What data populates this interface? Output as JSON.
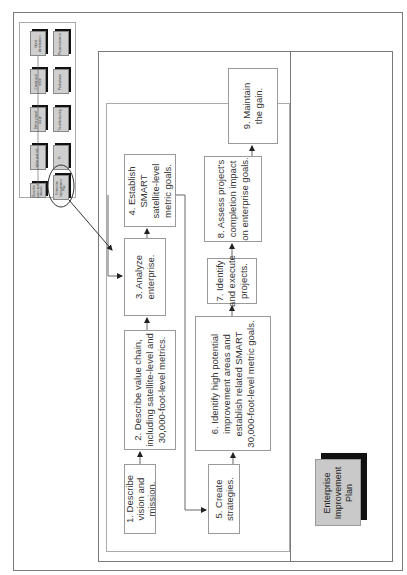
{
  "thumbnail": {
    "top_row": [
      "Need identification",
      "Create and refine",
      "Define project scope",
      "Value and risk",
      "Describe vision and mission"
    ],
    "bottom_row": [
      "Project closeout",
      "Productivize",
      "Troubleshooting",
      "Pi",
      "Enterprise Improvement Plan"
    ],
    "highlighted": "Enterprise Improvement Plan"
  },
  "steps": [
    {
      "id": 1,
      "label": "1. Describe vision and mission."
    },
    {
      "id": 2,
      "label": "2. Describe value chain, including satellite-level and 30,000-foot-level metrics."
    },
    {
      "id": 3,
      "label": "3. Analyze enterprise."
    },
    {
      "id": 4,
      "label": "4. Establish SMART satellite-level metric goals."
    },
    {
      "id": 5,
      "label": "5. Create strategies."
    },
    {
      "id": 6,
      "label": "6. Identify high potential improvement areas and establish related SMART 30,000-foot-level metric goals."
    },
    {
      "id": 7,
      "label": "7. Identify and execute projects."
    },
    {
      "id": 8,
      "label": "8. Assess project's completion impact on enterprise goals."
    },
    {
      "id": 9,
      "label": "9. Maintain the gain."
    }
  ],
  "plan_label": "Enterprise Improvement Plan",
  "colors": {
    "line": "#333333",
    "box_border": "#9a9a9a",
    "thumb_fill": "#cfcfcf",
    "shadow": "#111111"
  }
}
